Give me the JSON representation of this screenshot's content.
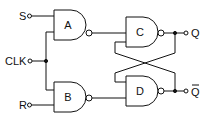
{
  "diagram": {
    "type": "clocked SR flip-flop (NAND gates)",
    "inputs": [
      {
        "label": "S"
      },
      {
        "label": "CLK"
      },
      {
        "label": "R"
      }
    ],
    "gates": [
      {
        "label": "A",
        "type": "NAND"
      },
      {
        "label": "B",
        "type": "NAND"
      },
      {
        "label": "C",
        "type": "NAND"
      },
      {
        "label": "D",
        "type": "NAND"
      }
    ],
    "outputs": [
      {
        "label": "Q"
      },
      {
        "label": "Q"
      }
    ],
    "colors": {
      "stroke": "#111111",
      "background": "#ffffff"
    }
  }
}
